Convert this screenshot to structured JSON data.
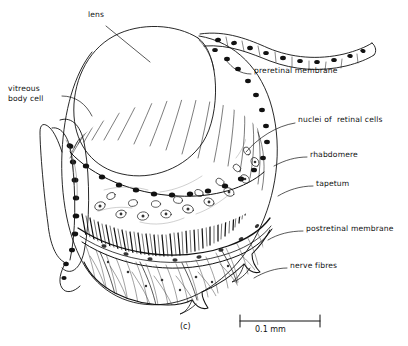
{
  "figure": {
    "caption_label": "(c)",
    "background_color": "#ffffff",
    "ink_color": "#111111"
  },
  "labels": [
    {
      "id": "lens",
      "text": "lens",
      "x": 88,
      "y": 14,
      "align": "left"
    },
    {
      "id": "vitreous-body-cell",
      "text": "vitreous\nbody cell",
      "x": 8,
      "y": 88,
      "align": "left"
    },
    {
      "id": "preretinal-membrane",
      "text": "preretinal membrane",
      "x": 254,
      "y": 70,
      "align": "left"
    },
    {
      "id": "nuclei-of-retinal-cells",
      "text": "nuclei of  retinal cells",
      "x": 298,
      "y": 119,
      "align": "left"
    },
    {
      "id": "rhabdomere",
      "text": "rhabdomere",
      "x": 310,
      "y": 154,
      "align": "left"
    },
    {
      "id": "tapetum",
      "text": "tapetum",
      "x": 316,
      "y": 183,
      "align": "left"
    },
    {
      "id": "postretinal-membrane",
      "text": "postretinal membrane",
      "x": 306,
      "y": 228,
      "align": "left"
    },
    {
      "id": "nerve-fibres",
      "text": "nerve fibres",
      "x": 290,
      "y": 265,
      "align": "left"
    }
  ],
  "scale_bar": {
    "text": "0.1 mm",
    "x1": 240,
    "x2": 320,
    "y": 321,
    "label_x": 255,
    "label_y": 325
  },
  "structures": [
    {
      "id": "lens",
      "name": "lens",
      "description": "large smooth oval body filling upper-left of the eye"
    },
    {
      "id": "vitreous-body",
      "name": "vitreous body",
      "description": "narrow cell band along the left margin carrying dark nuclei"
    },
    {
      "id": "preretinal-membrane",
      "name": "preretinal membrane",
      "description": "wavy nucleated band sweeping off to the upper right"
    },
    {
      "id": "retinal-cell-layer",
      "name": "retinal cell layer",
      "description": "radially striated zone with scattered oval nuclei"
    },
    {
      "id": "rhabdomere-layer",
      "name": "rhabdomere layer",
      "description": "dense palisade of short vertical rods"
    },
    {
      "id": "tapetum",
      "name": "tapetum",
      "description": "dark reflective band beneath the rhabdomeres"
    },
    {
      "id": "postretinal-membrane",
      "name": "postretinal membrane",
      "description": "boundary line below the tapetum"
    },
    {
      "id": "nerve-fibre-layer",
      "name": "nerve fibre layer",
      "description": "fibrous basal mesh forming the scalloped lower margin"
    }
  ]
}
